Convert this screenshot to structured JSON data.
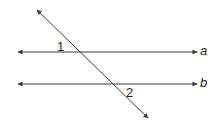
{
  "diagram": {
    "colors": {
      "line": "#3a3a3a",
      "text": "#231f20"
    },
    "lines": [
      {
        "id": "a",
        "label": "a",
        "x1": 18,
        "y1": 52,
        "x2": 197,
        "y2": 52
      },
      {
        "id": "b",
        "label": "b",
        "x1": 18,
        "y1": 84,
        "x2": 197,
        "y2": 84
      },
      {
        "id": "transversal",
        "x1": 37,
        "y1": 10,
        "x2": 148,
        "y2": 118
      }
    ],
    "angles": [
      {
        "id": "1",
        "label": "1"
      },
      {
        "id": "2",
        "label": "2"
      }
    ]
  }
}
